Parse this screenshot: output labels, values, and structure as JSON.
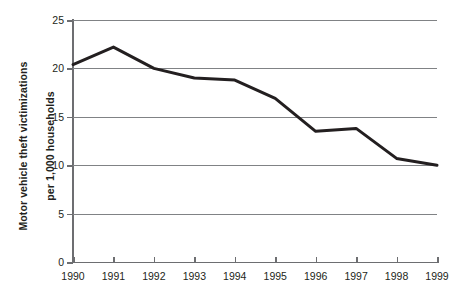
{
  "chart_data": {
    "type": "line",
    "title": "",
    "xlabel": "",
    "ylabel": "Motor vehicle theft victimizations per 1,000 households",
    "ylabel_lines": [
      "Motor vehicle theft victimizations",
      "per 1,000 households"
    ],
    "categories": [
      "1990",
      "1991",
      "1992",
      "1993",
      "1994",
      "1995",
      "1996",
      "1997",
      "1998",
      "1999"
    ],
    "x": [
      1990,
      1991,
      1992,
      1993,
      1994,
      1995,
      1996,
      1997,
      1998,
      1999
    ],
    "values": [
      20.4,
      22.2,
      20.0,
      19.0,
      18.8,
      16.9,
      13.5,
      13.8,
      10.7,
      10.0
    ],
    "series": [
      {
        "name": "Motor vehicle theft victimizations per 1,000 households",
        "values": [
          20.4,
          22.2,
          20.0,
          19.0,
          18.8,
          16.9,
          13.5,
          13.8,
          10.7,
          10.0
        ]
      }
    ],
    "ylim": [
      0,
      25
    ],
    "y_ticks": [
      0,
      5,
      10,
      15,
      20,
      25
    ],
    "y_tick_labels": [
      "0",
      "5",
      "10",
      "15",
      "20",
      "25"
    ],
    "grid": true,
    "grid_axis": "y",
    "legend": false,
    "legend_position": "none",
    "line_color": "#231f20",
    "line_width": 3,
    "grid_color": "#808285",
    "axis_color": "#6d6e71",
    "background_color": "#ffffff",
    "annotations": []
  }
}
